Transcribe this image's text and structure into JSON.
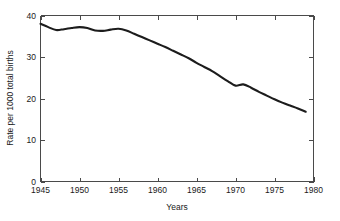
{
  "chart_data": {
    "type": "line",
    "title": "",
    "xlabel": "Years",
    "ylabel": "Rate per 1000 total births",
    "xlim": [
      1945,
      1980
    ],
    "ylim": [
      0,
      40
    ],
    "grid": false,
    "legend": null,
    "xticks": [
      1945,
      1950,
      1955,
      1960,
      1965,
      1970,
      1975,
      1980
    ],
    "xtick_labels": [
      "1945",
      "1950",
      "1955",
      "1960",
      "1965",
      "1970",
      "1975",
      "1980"
    ],
    "yticks": [
      0,
      10,
      20,
      30,
      40
    ],
    "ytick_labels": [
      "0",
      "10",
      "20",
      "30",
      "40"
    ],
    "series": [
      {
        "name": "Rate per 1000 total births",
        "color": "#1c1c1c",
        "x": [
          1945,
          1946,
          1947,
          1948,
          1949,
          1950,
          1951,
          1952,
          1953,
          1954,
          1955,
          1956,
          1957,
          1958,
          1959,
          1960,
          1961,
          1962,
          1963,
          1964,
          1965,
          1966,
          1967,
          1968,
          1969,
          1970,
          1971,
          1972,
          1973,
          1974,
          1975,
          1976,
          1977,
          1978,
          1979
        ],
        "values": [
          38.0,
          37.2,
          36.5,
          36.7,
          37.0,
          37.2,
          37.0,
          36.4,
          36.3,
          36.6,
          36.8,
          36.4,
          35.6,
          34.8,
          34.0,
          33.2,
          32.4,
          31.5,
          30.6,
          29.7,
          28.6,
          27.6,
          26.6,
          25.4,
          24.2,
          23.1,
          23.4,
          22.6,
          21.6,
          20.7,
          19.8,
          19.0,
          18.3,
          17.6,
          16.8
        ]
      }
    ]
  },
  "axis_labels": {
    "x_title": "Years",
    "y_title": "Rate per 1000 total births"
  }
}
